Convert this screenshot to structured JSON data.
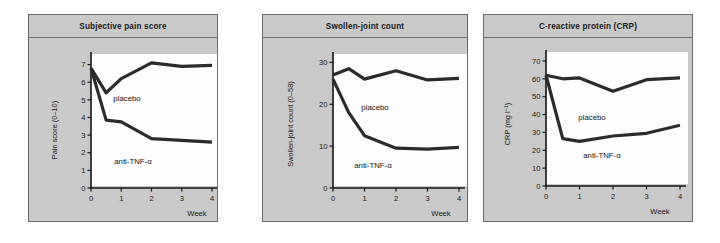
{
  "figure": {
    "panel_bg": "#c9c9c9",
    "plot_bg": "#fdfdfd",
    "line_color": "#2b2b2b",
    "axis_color": "#141414",
    "border_color": "#6d6d6d"
  },
  "panels": [
    {
      "title": "Subjective pain score",
      "placebo_label": "placebo",
      "treatment_label": "anti-TNF-α",
      "xaxis_name": "Week"
    },
    {
      "title": "Swollen-joint count",
      "placebo_label": "placebo",
      "treatment_label": "anti-TNF-α",
      "xaxis_name": "Week"
    },
    {
      "title": "C-reactive protein (CRP)",
      "placebo_label": "placebo",
      "treatment_label": "anti-TNF-α",
      "xaxis_name": "Week"
    }
  ],
  "chart_data": [
    {
      "type": "line",
      "title": "Subjective pain score",
      "xlabel": "Week",
      "ylabel": "Pain score (0–10)",
      "ylabel_prefix": "Pain score (0–10)",
      "x": [
        0,
        0.5,
        1,
        2,
        3,
        4
      ],
      "xlim": [
        0,
        4
      ],
      "ylim": [
        0,
        7.6
      ],
      "xticks": [
        0,
        1,
        2,
        3,
        4
      ],
      "xticklabels": [
        "0",
        "1",
        "2",
        "3",
        "4"
      ],
      "yticks": [
        0,
        1,
        2,
        3,
        4,
        5,
        6,
        7
      ],
      "yticklabels": [
        "0",
        "1",
        "2",
        "3",
        "4",
        "5",
        "6",
        "7"
      ],
      "grid": false,
      "legend": "inline-annotation",
      "series": [
        {
          "name": "placebo",
          "values": [
            6.8,
            5.4,
            6.2,
            7.1,
            6.9,
            6.95
          ]
        },
        {
          "name": "anti-TNF-α",
          "values": [
            6.8,
            3.85,
            3.75,
            2.8,
            2.7,
            2.6
          ]
        }
      ]
    },
    {
      "type": "line",
      "title": "Swollen-joint count",
      "xlabel": "Week",
      "ylabel": "Swollen-joint count (0–58)",
      "x": [
        0,
        0.5,
        1,
        2,
        3,
        4
      ],
      "xlim": [
        0,
        4
      ],
      "ylim": [
        0,
        32
      ],
      "xticks": [
        0,
        1,
        2,
        3,
        4
      ],
      "xticklabels": [
        "0",
        "1",
        "2",
        "3",
        "4"
      ],
      "yticks": [
        0,
        10,
        20,
        30
      ],
      "yticklabels": [
        "0",
        "10",
        "20",
        "30"
      ],
      "grid": false,
      "legend": "inline-annotation",
      "series": [
        {
          "name": "placebo",
          "values": [
            27,
            28.5,
            26,
            28,
            25.8,
            26.2
          ]
        },
        {
          "name": "anti-TNF-α",
          "values": [
            26,
            18,
            12.5,
            9.5,
            9.3,
            9.7
          ]
        }
      ]
    },
    {
      "type": "line",
      "title": "C-reactive protein (CRP)",
      "xlabel": "Week",
      "ylabel": "CRP (mg l−1)",
      "ylabel_main": "CRP (mg l",
      "ylabel_sup": "−1",
      "ylabel_tail": ")",
      "x": [
        0,
        0.5,
        1,
        2,
        3,
        4
      ],
      "xlim": [
        0,
        4
      ],
      "ylim": [
        0,
        75
      ],
      "xticks": [
        0,
        1,
        2,
        3,
        4
      ],
      "xticklabels": [
        "0",
        "1",
        "2",
        "3",
        "4"
      ],
      "yticks": [
        0,
        10,
        20,
        30,
        40,
        50,
        60,
        70
      ],
      "yticklabels": [
        "0",
        "10",
        "20",
        "30",
        "40",
        "50",
        "60",
        "70"
      ],
      "grid": false,
      "legend": "inline-annotation",
      "series": [
        {
          "name": "placebo",
          "values": [
            62,
            60,
            60.5,
            53,
            59.5,
            60.5
          ]
        },
        {
          "name": "anti-TNF-α",
          "values": [
            62,
            26.5,
            25,
            28,
            29.5,
            34
          ]
        }
      ]
    }
  ]
}
